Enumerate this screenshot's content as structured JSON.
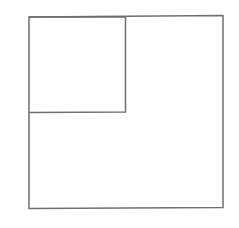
{
  "diagram": {
    "background": "#ffffff",
    "stroke_color": "#6f6f6f",
    "stroke_width": 1.5,
    "shapes": [
      {
        "id": "outer-square",
        "type": "rect",
        "points": [
          [
            29,
            17
          ],
          [
            223,
            15.5
          ],
          [
            223,
            207.5
          ],
          [
            29,
            208.5
          ]
        ]
      },
      {
        "id": "inner-square",
        "type": "rect",
        "points": [
          [
            29,
            17
          ],
          [
            125.5,
            17
          ],
          [
            125.5,
            112
          ],
          [
            29,
            112.5
          ]
        ]
      }
    ]
  }
}
